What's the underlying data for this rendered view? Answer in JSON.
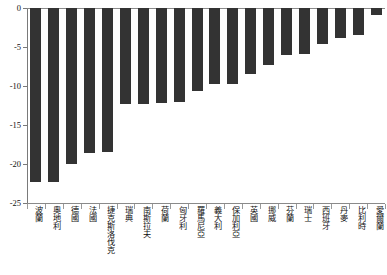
{
  "chart_data": {
    "type": "bar",
    "title": "",
    "subtitle": "",
    "xlabel": "",
    "ylabel": "",
    "orientation": "vertical",
    "grid": false,
    "legend": "none",
    "ylim": [
      -25,
      0
    ],
    "ytick_values": [
      0,
      -5,
      -10,
      -15,
      -20,
      -25
    ],
    "ytick_labels": [
      "0",
      "-5",
      "-10",
      "-15",
      "-20",
      "-25"
    ],
    "categories": [
      "波蘭",
      "奧地利",
      "德國",
      "法國",
      "捷克斯洛伐克",
      "瑞典",
      "南斯拉夫",
      "荷蘭",
      "匈牙利",
      "羅馬尼亞",
      "義大利",
      "保加利亞",
      "英國",
      "挪威",
      "芬蘭",
      "瑞士",
      "西班牙",
      "丹麥",
      "比利時",
      "愛爾蘭"
    ],
    "values": [
      -22.3,
      -22.3,
      -20.0,
      -18.6,
      -18.4,
      -12.3,
      -12.3,
      -12.2,
      -12.1,
      -10.7,
      -9.7,
      -9.7,
      -8.5,
      -7.3,
      -6.0,
      -5.9,
      -4.6,
      -3.9,
      -3.5,
      -0.9
    ],
    "bar_color": "#333333",
    "axis_color": "#8a8a8a",
    "background_color": "#ffffff"
  }
}
